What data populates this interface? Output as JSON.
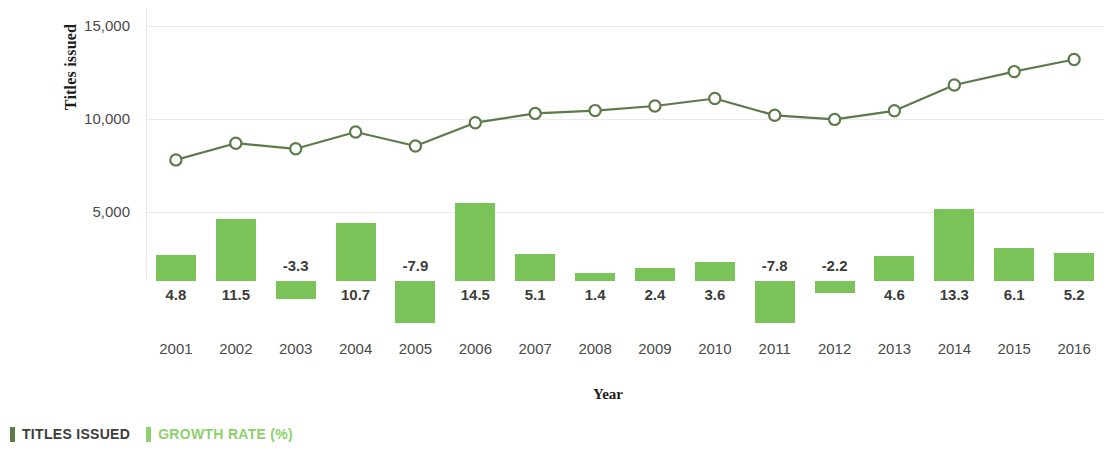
{
  "chart_data": {
    "type": "bar",
    "title": "",
    "xlabel": "Year",
    "ylabel": "Titles issued",
    "categories": [
      "2001",
      "2002",
      "2003",
      "2004",
      "2005",
      "2006",
      "2007",
      "2008",
      "2009",
      "2010",
      "2011",
      "2012",
      "2013",
      "2014",
      "2015",
      "2016"
    ],
    "ylim": [
      0,
      15000
    ],
    "y_ticks": [
      "5,000",
      "10,000",
      "15,000"
    ],
    "y_tick_values": [
      5000,
      10000,
      15000
    ],
    "grid": true,
    "legend_position": "bottom-left",
    "series": [
      {
        "name": "TITLES ISSUED",
        "type": "line",
        "color": "#5d7a4b",
        "marker": "open-circle",
        "values": [
          7800,
          8700,
          8400,
          9300,
          8550,
          9800,
          10300,
          10450,
          10700,
          11100,
          10200,
          9980,
          10440,
          11830,
          12550,
          13200
        ]
      },
      {
        "name": "GROWTH RATE (%)",
        "type": "bar",
        "color": "#79c358",
        "values": [
          4.8,
          11.5,
          -3.3,
          10.7,
          -7.9,
          14.5,
          5.1,
          1.4,
          2.4,
          3.6,
          -7.8,
          -2.2,
          4.6,
          13.3,
          6.1,
          5.2
        ],
        "value_labels": [
          "4.8",
          "11.5",
          "-3.3",
          "10.7",
          "-7.9",
          "14.5",
          "5.1",
          "1.4",
          "2.4",
          "3.6",
          "-7.8",
          "-2.2",
          "4.6",
          "13.3",
          "6.1",
          "5.2"
        ]
      }
    ]
  },
  "axes": {
    "y_title": "Titles issued",
    "x_title": "Year"
  },
  "legend": {
    "items": [
      {
        "label": "TITLES ISSUED",
        "color": "#5d7a4b",
        "text_color": "#3c3c3a"
      },
      {
        "label": "GROWTH RATE (%)",
        "color": "#8ed06d",
        "text_color": "#8ed06d"
      }
    ]
  },
  "colors": {
    "line": "#5d7a4b",
    "bar": "#79c358",
    "grid": "#eceae6",
    "text": "#4a4a48",
    "label_text": "#3c3c3a"
  }
}
